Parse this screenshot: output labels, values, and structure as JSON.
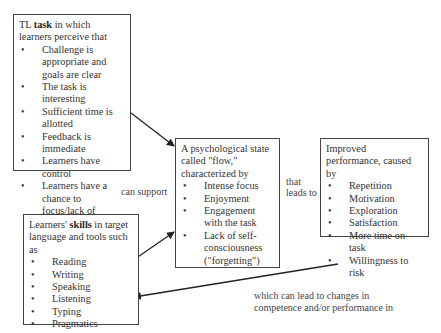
{
  "boxes": {
    "task": {
      "head_pre": "TL ",
      "head_bold": "task",
      "head_post": " in which learners perceive that",
      "items": [
        "Challenge is appropriate and goals are clear",
        "The task is interesting",
        "Sufficient time  is allotted",
        "Feedback is immediate",
        "Learners have control",
        "Learners have a chance to focus/lack of interruptions"
      ]
    },
    "flow": {
      "head": "A psychological state called \"flow,\" characterized by",
      "items": [
        "Intense focus",
        "Enjoyment",
        "Engagement with the task",
        "Lack of self-consciousness (\"forgetting\")"
      ]
    },
    "performance": {
      "head": "Improved performance, caused by",
      "items": [
        "Repetition",
        "Motivation",
        "Exploration",
        "Satisfaction",
        "More time on task",
        "Willingness to risk"
      ]
    },
    "skills": {
      "head_pre": "Learners' ",
      "head_bold": "skills",
      "head_post": " in target language and tools such as",
      "items": [
        "Reading",
        "Writing",
        "Speaking",
        "Listening",
        "Typing",
        "Pragmatics"
      ]
    }
  },
  "labels": {
    "can_support": "can support",
    "that": "that",
    "leads_to": "leads to",
    "which_line1": "which can lead to changes in",
    "which_line2": "competence and/or performance in"
  },
  "colors": {
    "border": "#444444",
    "arrow": "#222222",
    "text": "#333333"
  }
}
